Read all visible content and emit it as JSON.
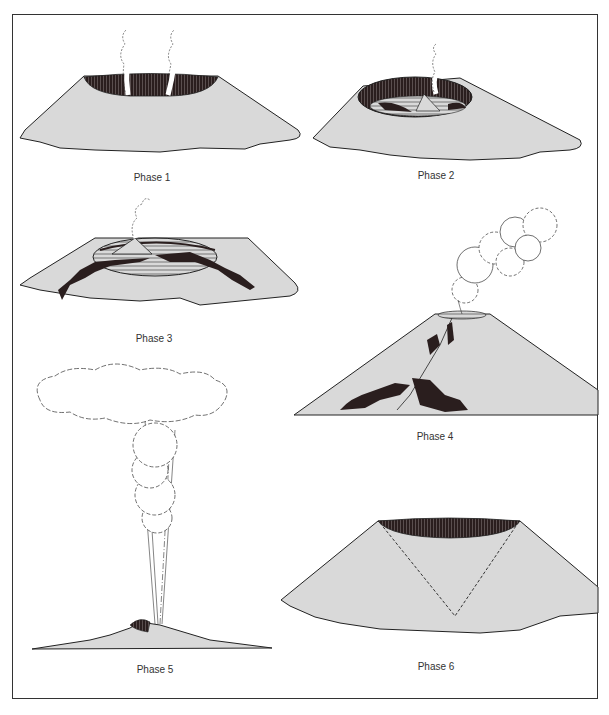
{
  "diagram": {
    "type": "volcano eruption phases",
    "colors": {
      "ground": "#d9d9d9",
      "lava": "#2a1e1e",
      "outline": "#222222",
      "background": "#ffffff"
    },
    "phases": [
      {
        "id": 1,
        "label": "Phase 1",
        "depicts": "broad shield volcano with dark crater and two steam plumes"
      },
      {
        "id": 2,
        "label": "Phase 2",
        "depicts": "caldera with lava lake, small cinder cone and steam plume"
      },
      {
        "id": 3,
        "label": "Phase 3",
        "depicts": "filled caldera with cinder cone, lava flows overflowing down flanks"
      },
      {
        "id": 4,
        "label": "Phase 4",
        "depicts": "steep stratovolcano with large ash cloud and fissure lava flows"
      },
      {
        "id": 5,
        "label": "Phase 5",
        "depicts": "low volcano with tall eruption column and mushroom ash cloud"
      },
      {
        "id": 6,
        "label": "Phase 6",
        "depicts": "truncated cone with dark crater and dashed inverted-cone outline"
      }
    ]
  }
}
